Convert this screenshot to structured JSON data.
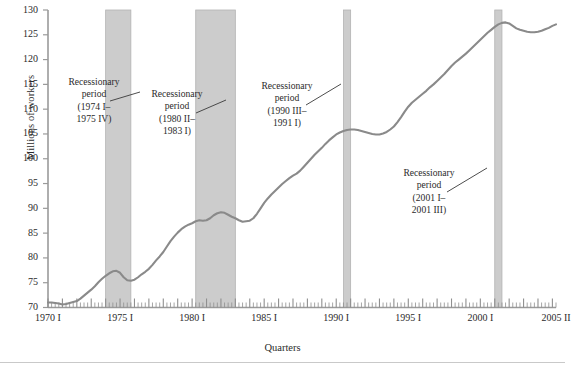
{
  "chart_data": {
    "type": "line",
    "title": "",
    "xlabel": "Quarters",
    "ylabel": "Millions of workers",
    "ylim": [
      70,
      130
    ],
    "ytick_step": 5,
    "yticks": [
      70,
      75,
      80,
      85,
      90,
      95,
      100,
      105,
      110,
      115,
      120,
      125,
      130
    ],
    "ytick_labels": [
      "70",
      "75",
      "80",
      "85",
      "90",
      "95",
      "100",
      "105",
      "110",
      "115",
      "120",
      "125",
      "130"
    ],
    "xticks": [
      1970.0,
      1975.0,
      1980.0,
      1985.0,
      1990.0,
      1995.0,
      2000.0,
      2005.25
    ],
    "xtick_labels": [
      "1970 I",
      "1975 I",
      "1980 I",
      "1985 I",
      "1990 I",
      "1995 I",
      "2000 I",
      "2005 II"
    ],
    "xlim": [
      1970.0,
      2005.25
    ],
    "minor_ticks": "quarterly",
    "grid": false,
    "legend": "none",
    "line_color": "#8a8a8a",
    "band_color": "#cccccc",
    "axis_color": "#9a9a9a",
    "series": [
      {
        "name": "Civilian employment",
        "x": [
          1970.0,
          1970.25,
          1970.5,
          1970.75,
          1971.0,
          1971.25,
          1971.5,
          1971.75,
          1972.0,
          1972.25,
          1972.5,
          1972.75,
          1973.0,
          1973.25,
          1973.5,
          1973.75,
          1974.0,
          1974.25,
          1974.5,
          1974.75,
          1975.0,
          1975.25,
          1975.5,
          1975.75,
          1976.0,
          1976.25,
          1976.5,
          1976.75,
          1977.0,
          1977.25,
          1977.5,
          1977.75,
          1978.0,
          1978.25,
          1978.5,
          1978.75,
          1979.0,
          1979.25,
          1979.5,
          1979.75,
          1980.0,
          1980.25,
          1980.5,
          1980.75,
          1981.0,
          1981.25,
          1981.5,
          1981.75,
          1982.0,
          1982.25,
          1982.5,
          1982.75,
          1983.0,
          1983.25,
          1983.5,
          1983.75,
          1984.0,
          1984.25,
          1984.5,
          1984.75,
          1985.0,
          1985.25,
          1985.5,
          1985.75,
          1986.0,
          1986.25,
          1986.5,
          1986.75,
          1987.0,
          1987.25,
          1987.5,
          1987.75,
          1988.0,
          1988.25,
          1988.5,
          1988.75,
          1989.0,
          1989.25,
          1989.5,
          1989.75,
          1990.0,
          1990.25,
          1990.5,
          1990.75,
          1991.0,
          1991.25,
          1991.5,
          1991.75,
          1992.0,
          1992.25,
          1992.5,
          1992.75,
          1993.0,
          1993.25,
          1993.5,
          1993.75,
          1994.0,
          1994.25,
          1994.5,
          1994.75,
          1995.0,
          1995.25,
          1995.5,
          1995.75,
          1996.0,
          1996.25,
          1996.5,
          1996.75,
          1997.0,
          1997.25,
          1997.5,
          1997.75,
          1998.0,
          1998.25,
          1998.5,
          1998.75,
          1999.0,
          1999.25,
          1999.5,
          1999.75,
          2000.0,
          2000.25,
          2000.5,
          2000.75,
          2001.0,
          2001.25,
          2001.5,
          2001.75,
          2002.0,
          2002.25,
          2002.5,
          2002.75,
          2003.0,
          2003.25,
          2003.5,
          2003.75,
          2004.0,
          2004.25,
          2004.5,
          2004.75,
          2005.0,
          2005.25
        ],
        "y": [
          71.0,
          71.0,
          70.9,
          70.8,
          70.6,
          70.7,
          70.9,
          71.1,
          71.3,
          71.8,
          72.4,
          73.0,
          73.6,
          74.3,
          75.1,
          75.8,
          76.4,
          76.9,
          77.3,
          77.4,
          77.0,
          76.1,
          75.5,
          75.4,
          75.6,
          76.1,
          76.7,
          77.2,
          77.8,
          78.6,
          79.5,
          80.3,
          81.2,
          82.3,
          83.4,
          84.3,
          85.1,
          85.8,
          86.3,
          86.7,
          87.0,
          87.4,
          87.6,
          87.5,
          87.6,
          88.0,
          88.6,
          89.0,
          89.2,
          89.1,
          88.7,
          88.3,
          88.0,
          87.6,
          87.3,
          87.4,
          87.5,
          88.0,
          88.9,
          90.0,
          91.1,
          92.0,
          92.8,
          93.5,
          94.2,
          94.9,
          95.5,
          96.1,
          96.6,
          97.0,
          97.6,
          98.4,
          99.2,
          100.0,
          100.8,
          101.5,
          102.2,
          103.0,
          103.7,
          104.3,
          104.9,
          105.3,
          105.6,
          105.8,
          105.9,
          105.9,
          105.8,
          105.6,
          105.4,
          105.2,
          105.0,
          104.9,
          104.9,
          105.1,
          105.4,
          105.9,
          106.5,
          107.4,
          108.4,
          109.5,
          110.5,
          111.3,
          111.9,
          112.5,
          113.1,
          113.7,
          114.4,
          115.0,
          115.7,
          116.4,
          117.1,
          117.9,
          118.7,
          119.4,
          120.0,
          120.6,
          121.2,
          121.9,
          122.6,
          123.3,
          124.0,
          124.7,
          125.4,
          126.0,
          126.6,
          127.1,
          127.4,
          127.5,
          127.3,
          126.8,
          126.3,
          126.0,
          125.8,
          125.6,
          125.5,
          125.5,
          125.6,
          125.8,
          126.1,
          126.4,
          126.8,
          127.1
        ]
      }
    ],
    "recession_bands": [
      {
        "label": "Recessionary period (1974 I–1975 IV)",
        "start": 1974.0,
        "end": 1975.75,
        "line1": "Recessionary",
        "line2": "period",
        "line3": "(1974 I–",
        "line4": "1975 IV)"
      },
      {
        "label": "Recessionary period (1980 II–1983 I)",
        "start": 1980.25,
        "end": 1983.0,
        "line1": "Recessionary",
        "line2": "period",
        "line3": "(1980 II–",
        "line4": "1983 I)"
      },
      {
        "label": "Recessionary period (1990 III–1991 I)",
        "start": 1990.5,
        "end": 1991.0,
        "line1": "Recessionary",
        "line2": "period",
        "line3": "(1990 III–",
        "line4": "1991 I)"
      },
      {
        "label": "Recessionary period (2001 I–2001 III)",
        "start": 2001.0,
        "end": 2001.5,
        "line1": "Recessionary",
        "line2": "period",
        "line3": "(2001 I–",
        "line4": "2001 III)"
      }
    ]
  },
  "axes": {
    "ylabel": "Millions of workers",
    "xlabel": "Quarters",
    "ytick_labels": [
      "130",
      "125",
      "120",
      "115",
      "110",
      "105",
      "100",
      "95",
      "90",
      "85",
      "80",
      "75",
      "70"
    ],
    "xtick_labels": [
      "1970 I",
      "1975 I",
      "1980 I",
      "1985 I",
      "1990 I",
      "1995 I",
      "2000 I",
      "2005 II"
    ]
  },
  "annotations": [
    {
      "line1": "Recessionary",
      "line2": "period",
      "line3": "(1974 I–",
      "line4": "1975 IV)"
    },
    {
      "line1": "Recessionary",
      "line2": "period",
      "line3": "(1980 II–",
      "line4": "1983 I)"
    },
    {
      "line1": "Recessionary",
      "line2": "period",
      "line3": "(1990 III–",
      "line4": "1991 I)"
    },
    {
      "line1": "Recessionary",
      "line2": "period",
      "line3": "(2001 I–",
      "line4": "2001 III)"
    }
  ]
}
